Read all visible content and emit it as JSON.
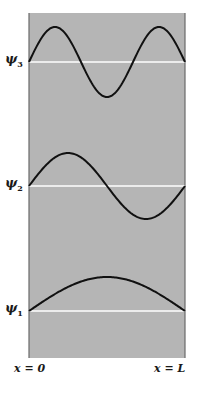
{
  "figure": {
    "panel": {
      "x0": 29,
      "x1": 185,
      "y0": 13,
      "y1": 358,
      "fill": "#b5b5b5",
      "border": "#6a6a6a"
    },
    "baseline_color": "#ffffff",
    "curve_color": "#111111",
    "x_labels": {
      "left": "x = 0",
      "right": "x = L"
    },
    "states": [
      {
        "label": "ψ",
        "sub": "3",
        "n": 3,
        "baseline_y": 62,
        "amplitude": 35
      },
      {
        "label": "ψ",
        "sub": "2",
        "n": 2,
        "baseline_y": 186,
        "amplitude": 33
      },
      {
        "label": "ψ",
        "sub": "1",
        "n": 1,
        "baseline_y": 311,
        "amplitude": 34
      }
    ]
  },
  "chart_data": {
    "type": "line",
    "title": "",
    "xlabel": "",
    "ylabel": "",
    "x_tick_labels": [
      "x = 0",
      "x = L"
    ],
    "series": [
      {
        "name": "ψ3",
        "function": "sin(3πx/L)",
        "nodes": 2
      },
      {
        "name": "ψ2",
        "function": "sin(2πx/L)",
        "nodes": 1
      },
      {
        "name": "ψ1",
        "function": "sin(πx/L)",
        "nodes": 0
      }
    ],
    "grid": false,
    "legend": "none (labels at left of each baseline)"
  }
}
